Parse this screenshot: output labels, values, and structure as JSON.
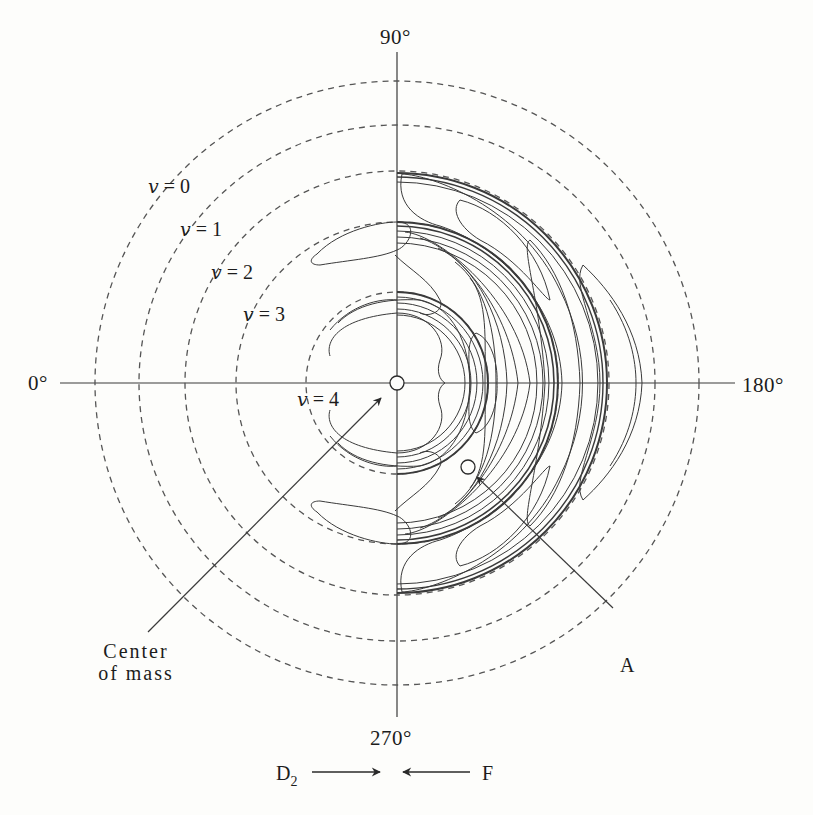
{
  "figure": {
    "center": {
      "x": 397,
      "y": 383
    },
    "colors": {
      "background": "#fdfdfb",
      "ink": "#2a2a2a",
      "dash": "#555555",
      "contour": "#3a3a3a"
    },
    "angle_labels": {
      "top": "90°",
      "left": "0°",
      "right": "180°",
      "bottom": "270°"
    },
    "vibrational_levels": [
      {
        "label": "v = 0",
        "v": "v",
        "n": "0",
        "radius": 302
      },
      {
        "label": "v = 1",
        "v": "v",
        "n": "1",
        "radius": 258
      },
      {
        "label": "v = 2",
        "v": "v",
        "n": "2",
        "radius": 212
      },
      {
        "label": "v = 3",
        "v": "v",
        "n": "3",
        "radius": 161
      },
      {
        "label": "v = 4",
        "v": "v",
        "n": "4",
        "radius": 91
      }
    ],
    "annotations": {
      "center_of_mass_line1": "Center",
      "center_of_mass_line2": "of mass",
      "point_a": "A",
      "reactant_left": "D",
      "reactant_left_sub": "2",
      "reactant_right": "F"
    },
    "markers": {
      "center_of_mass": {
        "x": 397,
        "y": 383,
        "r": 7
      },
      "point_a": {
        "x": 468,
        "y": 467,
        "r": 7
      }
    }
  }
}
